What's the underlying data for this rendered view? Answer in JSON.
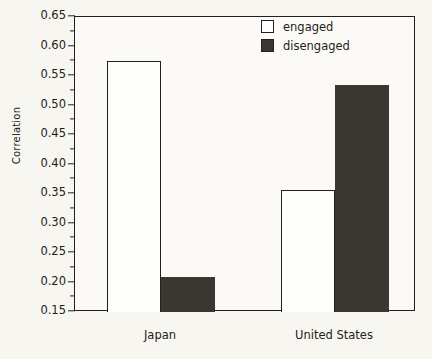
{
  "chart_data": {
    "type": "bar",
    "title": "",
    "xlabel": "",
    "ylabel": "Correlation",
    "categories": [
      "Japan",
      "United States"
    ],
    "series": [
      {
        "name": "engaged",
        "values": [
          0.575,
          0.357
        ],
        "color": "#ffffff"
      },
      {
        "name": "disengaged",
        "values": [
          0.21,
          0.535
        ],
        "color": "#3a3630"
      }
    ],
    "ylim": [
      0.15,
      0.65
    ],
    "ytick_labels": [
      "0.65",
      "0.60",
      "0.55",
      "0.50",
      "0.45",
      "0.40",
      "0.35",
      "0.30",
      "0.25",
      "0.20",
      "0.15"
    ],
    "ytick_values": [
      0.65,
      0.6,
      0.55,
      0.5,
      0.45,
      0.4,
      0.35,
      0.3,
      0.25,
      0.2,
      0.15
    ],
    "yminor_values": [
      0.625,
      0.575,
      0.525,
      0.475,
      0.425,
      0.375,
      0.325,
      0.275,
      0.225,
      0.175
    ],
    "grid": false,
    "legend_position": "top-right",
    "legend": [
      "engaged",
      "disengaged"
    ]
  },
  "axis": {
    "y_title": "Correlation"
  },
  "legend": {
    "items": [
      {
        "label": "engaged"
      },
      {
        "label": "disengaged"
      }
    ]
  },
  "colors": {
    "bar_dark": "#3a3630",
    "bar_light": "#ffffff",
    "axis": "#231f20",
    "background": "#f8f6f1"
  }
}
